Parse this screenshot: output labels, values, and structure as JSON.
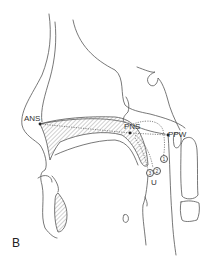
{
  "figure": {
    "panel_label": "B",
    "landmarks": {
      "ans": "ANS",
      "pns": "PNS",
      "ppw": "PPW"
    },
    "positions": [
      "1",
      "2",
      "3"
    ],
    "uvula_label": "U",
    "colors": {
      "line": "#555555",
      "hatch": "#888888",
      "background": "#ffffff"
    }
  }
}
